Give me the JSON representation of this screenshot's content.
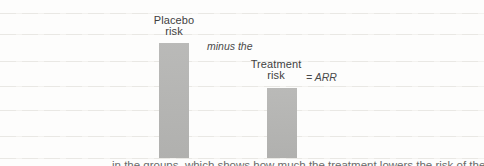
{
  "chart_data": {
    "type": "bar",
    "categories": [
      "Placebo risk",
      "Treatment risk"
    ],
    "values": [
      100,
      61
    ],
    "title": "",
    "xlabel": "",
    "ylabel": "",
    "ylim": [
      0,
      100
    ],
    "axes_shown": false,
    "grid": "faint horizontal ruled lines",
    "annotations": [
      "minus the",
      "= ARR"
    ],
    "bar_color": "#b6b6b4"
  },
  "labels": {
    "placebo_line1": "Placebo",
    "placebo_line2": "risk",
    "minus_note": "minus the",
    "treatment_line1": "Treatment",
    "treatment_line2": "risk",
    "arr_note": "= ARR"
  },
  "caption": {
    "clipped_text": "in the groups, which shows how much the treatment lowers the risk of the placebo"
  },
  "colors": {
    "background": "#fdfdfc",
    "bar": "#b6b6b4",
    "gridline": "#e9e8e4",
    "label_text": "#3f3f3f",
    "note_text": "#4a4a4a"
  }
}
